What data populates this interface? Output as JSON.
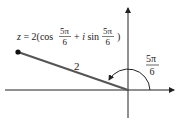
{
  "diagram": {
    "title_equation": {
      "prefix": "z = 2(cos",
      "frac1_num": "5π",
      "frac1_den": "6",
      "middle": "+ i sin",
      "frac2_num": "5π",
      "frac2_den": "6",
      "suffix": ")"
    },
    "segment_label": "2",
    "angle_label": {
      "num": "5π",
      "den": "6"
    },
    "colors": {
      "axis": "#222222",
      "segment": "#555555",
      "point": "#111111",
      "text": "#222222"
    }
  }
}
